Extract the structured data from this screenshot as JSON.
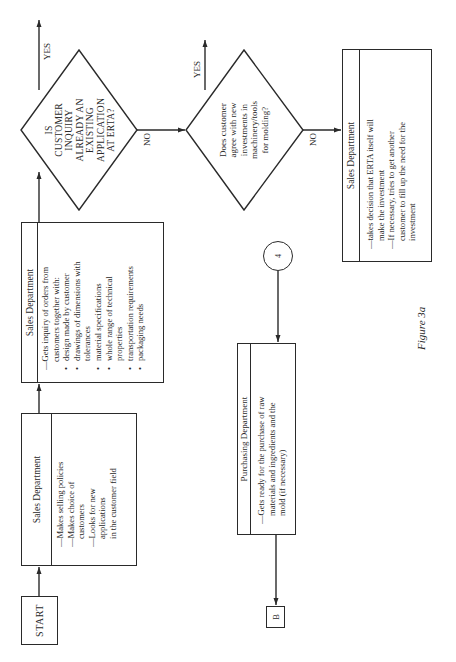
{
  "figure_caption": "Figure 3a",
  "start": {
    "label": "START"
  },
  "sales_box_1": {
    "header": "Sales Department",
    "lines": [
      "—Makes selling policies",
      "—Makes choice of",
      "customers",
      "—Looks for new",
      "applications",
      "in the customer field"
    ]
  },
  "sales_box_2": {
    "header": "Sales Department",
    "intro": [
      "—Gets inquiry of orders from",
      "customers together with:"
    ],
    "bullets": [
      [
        "design made by customer"
      ],
      [
        "drawings of dimensions with",
        "tolerances"
      ],
      [
        "material specifications"
      ],
      [
        "whole range of technical",
        "properties"
      ],
      [
        "transportation requirements"
      ],
      [
        "packaging needs"
      ]
    ]
  },
  "decision_1": {
    "lines": [
      "IS",
      "CUSTOMER",
      "INQUIRY",
      "ALREADY AN",
      "EXISTING",
      "APPLICATION",
      "AT ERTA?"
    ],
    "yes_label": "YES",
    "no_label": "NO"
  },
  "decision_2": {
    "lines": [
      "Does customer",
      "agree with new",
      "investments in",
      "machinery/tools",
      "for molding?"
    ],
    "yes_label": "YES",
    "no_label": "NO"
  },
  "sales_box_3": {
    "header": "Sales Department",
    "lines": [
      "—takes decision that ERTA itself will",
      "make the investment",
      "—If necessary, tries to get another",
      "customer to fill up the need for the",
      "investment"
    ]
  },
  "connector_4": {
    "label": "4"
  },
  "purchasing_box": {
    "header": "Purchasing Department",
    "lines": [
      "—Gets ready for the purchase of raw",
      "materials and ingredients and the",
      "mold (if necessary)"
    ]
  },
  "offpage_b": {
    "label": "B"
  }
}
